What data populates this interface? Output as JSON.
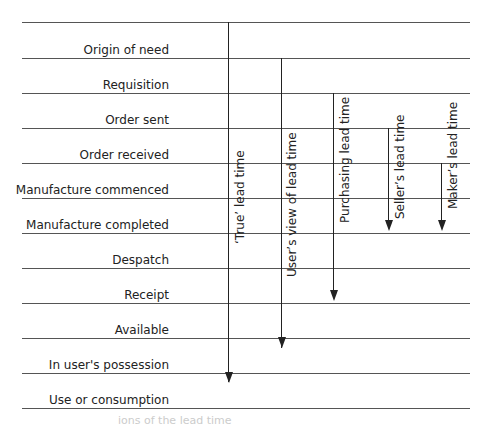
{
  "diagram": {
    "type": "lead-time-diagram",
    "stages": [
      "Origin of need",
      "Requisition",
      "Order sent",
      "Order received",
      "Manufacture commenced",
      "Manufacture completed",
      "Despatch",
      "Receipt",
      "Available",
      "In user's possession",
      "Use or consumption"
    ],
    "lead_times": [
      {
        "label": "‘True’ lead time",
        "from": "Origin of need",
        "to": "Use or consumption"
      },
      {
        "label": "User’s view of lead time",
        "from": "Requisition",
        "to": "In user's possession"
      },
      {
        "label": "Purchasing lead time",
        "from": "Order sent",
        "to": "Receipt"
      },
      {
        "label": "Seller’s lead time",
        "from": "Order received",
        "to": "Manufacture completed"
      },
      {
        "label": "Maker’s lead time",
        "from": "Manufacture commenced",
        "to": "Manufacture completed"
      }
    ],
    "caption_fragment": "ions of the lead time"
  }
}
